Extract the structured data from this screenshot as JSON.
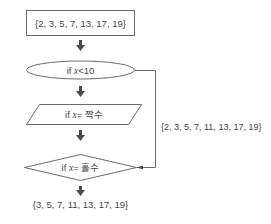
{
  "flowchart": {
    "start_set": "{2, 3, 5, 7, 13, 17, 19}",
    "condition1": {
      "prefix": "if ",
      "var": "x",
      "rest": "<10"
    },
    "condition2": {
      "prefix": "if ",
      "var": "x",
      "rest": "= 짝수"
    },
    "condition3": {
      "prefix": "if ",
      "var": "x",
      "rest": "= 홀수"
    },
    "side_set": "{2, 3, 5, 7, 11, 13, 17, 19}",
    "result_set": "{3, 5, 7, 11, 13, 17, 19}"
  },
  "colors": {
    "stroke": "#6a6a6a",
    "arrow": "#4a4a4a",
    "text": "#444444"
  }
}
